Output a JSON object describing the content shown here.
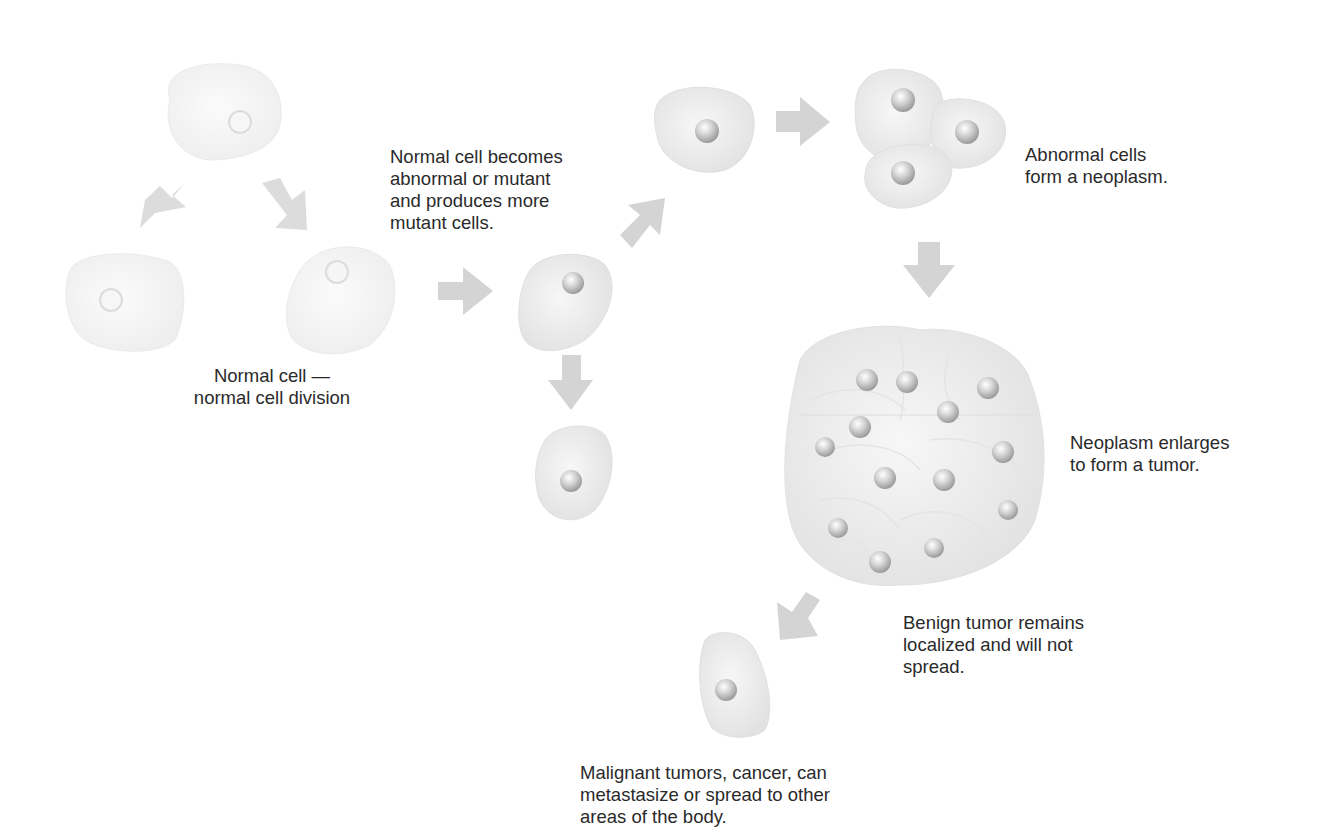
{
  "diagram": {
    "labels": {
      "normal": "Normal cell —\nnormal cell division",
      "mutant": "Normal cell becomes\nabnormal or mutant\nand produces more\nmutant cells.",
      "neoplasm": "Abnormal cells\nform a neoplasm.",
      "tumor": "Neoplasm enlarges\nto form a tumor.",
      "benign": "Benign tumor remains\nlocalized and will not\nspread.",
      "malignant": "Malignant tumors, cancer, can\nmetastasize or spread to other\nareas of the body."
    },
    "colors": {
      "cell_fill": "#eeeeee",
      "cell_edge": "#d8d8d8",
      "normal_cell_fill": "#f3f3f3",
      "arrow": "#d4d4d4",
      "nucleus": "#c9c9c9",
      "text": "#2a2a2a"
    },
    "stages": [
      {
        "id": "normal-division",
        "cells": 3
      },
      {
        "id": "mutant-cell",
        "cells": 1
      },
      {
        "id": "mutant-daughters",
        "cells": 2
      },
      {
        "id": "neoplasm",
        "cells": 3
      },
      {
        "id": "tumor",
        "cells": 14
      },
      {
        "id": "metastatic-cell",
        "cells": 1
      }
    ]
  }
}
